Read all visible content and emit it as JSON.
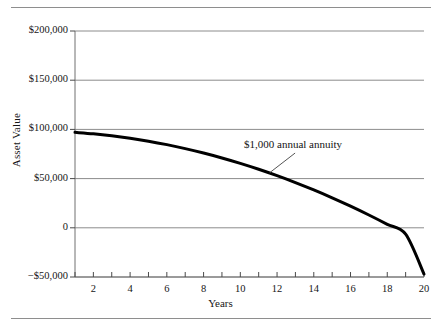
{
  "figure": {
    "top_rule": "horizontal-rule",
    "bottom_rule": "horizontal-rule"
  },
  "chart_data": {
    "type": "line",
    "title": "",
    "subtitle": "",
    "xlabel": "Years",
    "ylabel": "Asset Value",
    "xlim": [
      1,
      20
    ],
    "ylim": [
      -50000,
      200000
    ],
    "grid": true,
    "grid_axis": "y",
    "legend": null,
    "legend_position": "none",
    "ytick_labels": [
      "$200,000",
      "$150,000",
      "$100,000",
      "$50,000",
      "0",
      "−$50,000"
    ],
    "ytick_values": [
      200000,
      150000,
      100000,
      50000,
      0,
      -50000
    ],
    "xtick_labels": [
      "2",
      "4",
      "6",
      "8",
      "10",
      "12",
      "14",
      "16",
      "18",
      "20"
    ],
    "xtick_values": [
      2,
      4,
      6,
      8,
      10,
      12,
      14,
      16,
      18,
      20
    ],
    "minor_xticks": [
      1,
      2,
      3,
      4,
      5,
      6,
      7,
      8,
      9,
      10,
      11,
      12,
      13,
      14,
      15,
      16,
      17,
      18,
      19,
      20
    ],
    "annotations": [
      {
        "text": "$1,000 annual annuity",
        "x": 13.2,
        "y": 78000,
        "leader_from_x": 11.6,
        "leader_from_y": 56000,
        "style": "leader-line"
      }
    ],
    "series": [
      {
        "name": "$1,000 annual annuity",
        "color": "#000000",
        "line_width": 3,
        "x": [
          1,
          2,
          3,
          4,
          5,
          6,
          7,
          8,
          9,
          10,
          11,
          12,
          13,
          14,
          15,
          16,
          17,
          18,
          19,
          20
        ],
        "values": [
          97000,
          95500,
          93500,
          91000,
          88000,
          84500,
          80500,
          76000,
          71000,
          65500,
          59500,
          53000,
          46000,
          38500,
          30500,
          22000,
          13000,
          3500,
          -6500,
          -47000
        ]
      }
    ]
  }
}
